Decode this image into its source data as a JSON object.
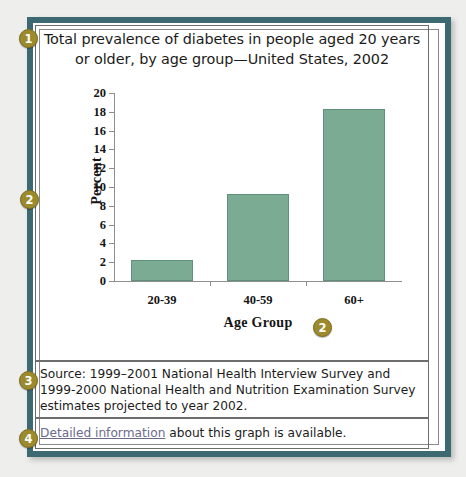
{
  "figure": {
    "title": "Total prevalence of diabetes in people aged 20 years or older, by age group—United States, 2002",
    "source_text": "Source: 1999–2001 National Health Interview Survey and 1999-2000 National Health and Nutrition Examination Survey estimates projected to year 2002.",
    "link_text": "Detailed information",
    "link_tail": " about this graph is available."
  },
  "badges": {
    "one": "1",
    "two_y": "2",
    "two_x": "2",
    "three": "3",
    "four": "4"
  },
  "colors": {
    "frame": "#3d6a72",
    "bar_fill": "#7cab93",
    "bar_stroke": "#60907a",
    "badge": "#9c8a2c",
    "link": "#6b6b8c",
    "page_background": "#eeeeec"
  },
  "chart_data": {
    "type": "bar",
    "title": "Total prevalence of diabetes in people aged 20 years or older, by age group—United States, 2002",
    "xlabel": "Age Group",
    "ylabel": "Percent",
    "categories": [
      "20-39",
      "40-59",
      "60+"
    ],
    "values": [
      2.2,
      9.3,
      18.3
    ],
    "ylim": [
      0,
      20
    ],
    "yticks": [
      0,
      2,
      4,
      6,
      8,
      10,
      12,
      14,
      16,
      18,
      20
    ],
    "ytick_labels": [
      "0",
      "2",
      "4",
      "6",
      "8",
      "10",
      "12",
      "14",
      "16",
      "18",
      "20"
    ],
    "grid": false,
    "legend": false,
    "units": "percent"
  }
}
